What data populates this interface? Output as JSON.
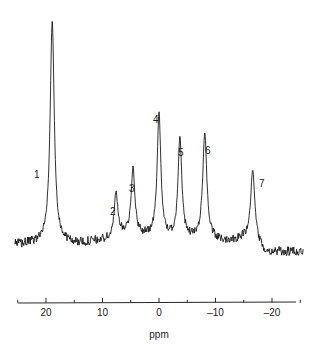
{
  "chart_data": {
    "type": "line",
    "title": "",
    "subtitle": "",
    "xlabel": "ppm",
    "ylabel": "",
    "grid": false,
    "legend_position": "none",
    "xlim": [
      25.5,
      -25.5
    ],
    "x_axis_reversed": true,
    "ylim": [
      0,
      1
    ],
    "tick_labels": [
      "20",
      "10",
      "0",
      "-10",
      "-20"
    ],
    "tick_values": [
      20,
      10,
      0,
      -10,
      -20
    ],
    "minor_tick_values": [
      25,
      15,
      5,
      -5,
      -15,
      -25
    ],
    "annotations": [
      {
        "label": "1",
        "ppm": 18.9,
        "rel_height": 1.0
      },
      {
        "label": "2",
        "ppm": 7.6,
        "rel_height": 0.2
      },
      {
        "label": "3",
        "ppm": 4.6,
        "rel_height": 0.29
      },
      {
        "label": "4",
        "ppm": 0.0,
        "rel_height": 0.55
      },
      {
        "label": "5",
        "ppm": -3.7,
        "rel_height": 0.45
      },
      {
        "label": "6",
        "ppm": -8.1,
        "rel_height": 0.47
      },
      {
        "label": "7",
        "ppm": -16.6,
        "rel_height": 0.33
      }
    ],
    "peaks": [
      {
        "id": 1,
        "ppm": 18.9,
        "rel_height": 1.0,
        "width_ppm": 0.55
      },
      {
        "id": 2,
        "ppm": 7.6,
        "rel_height": 0.205,
        "width_ppm": 0.45
      },
      {
        "id": 3,
        "ppm": 4.6,
        "rel_height": 0.295,
        "width_ppm": 0.5
      },
      {
        "id": 4,
        "ppm": 0.0,
        "rel_height": 0.56,
        "width_ppm": 0.5
      },
      {
        "id": 5,
        "ppm": -3.7,
        "rel_height": 0.455,
        "width_ppm": 0.5
      },
      {
        "id": 6,
        "ppm": -8.1,
        "rel_height": 0.48,
        "width_ppm": 0.55
      },
      {
        "id": 7,
        "ppm": -16.6,
        "rel_height": 0.33,
        "width_ppm": 0.6
      }
    ],
    "baseline_drift": [
      {
        "ppm": 25.5,
        "offset": 0.005
      },
      {
        "ppm": 20.0,
        "offset": 0.015
      },
      {
        "ppm": 14.0,
        "offset": 0.01
      },
      {
        "ppm": 9.0,
        "offset": 0.028
      },
      {
        "ppm": 6.0,
        "offset": 0.055
      },
      {
        "ppm": 2.0,
        "offset": 0.04
      },
      {
        "ppm": -2.0,
        "offset": 0.03
      },
      {
        "ppm": -6.0,
        "offset": 0.03
      },
      {
        "ppm": -11.0,
        "offset": 0.02
      },
      {
        "ppm": -15.0,
        "offset": 0.03
      },
      {
        "ppm": -19.0,
        "offset": -0.03
      },
      {
        "ppm": -25.5,
        "offset": -0.025
      }
    ],
    "noise_amplitude": 0.022,
    "line_color": "#1a1a1a",
    "background_color": "#ffffff",
    "axis_color": "#2b2b2b"
  },
  "axis": {
    "title": "ppm",
    "ticks": [
      {
        "label": "20",
        "value": 20
      },
      {
        "label": "10",
        "value": 10
      },
      {
        "label": "0",
        "value": 0
      },
      {
        "label": "–10",
        "value": -10
      },
      {
        "label": "–20",
        "value": -20
      }
    ]
  },
  "peak_labels": [
    {
      "text": "1",
      "x": 34,
      "y": 170
    },
    {
      "text": "2",
      "x": 110,
      "y": 207
    },
    {
      "text": "3",
      "x": 129,
      "y": 184
    },
    {
      "text": "4",
      "x": 153,
      "y": 115
    },
    {
      "text": "5",
      "x": 178,
      "y": 148
    },
    {
      "text": "6",
      "x": 205,
      "y": 146
    },
    {
      "text": "7",
      "x": 259,
      "y": 179
    }
  ]
}
